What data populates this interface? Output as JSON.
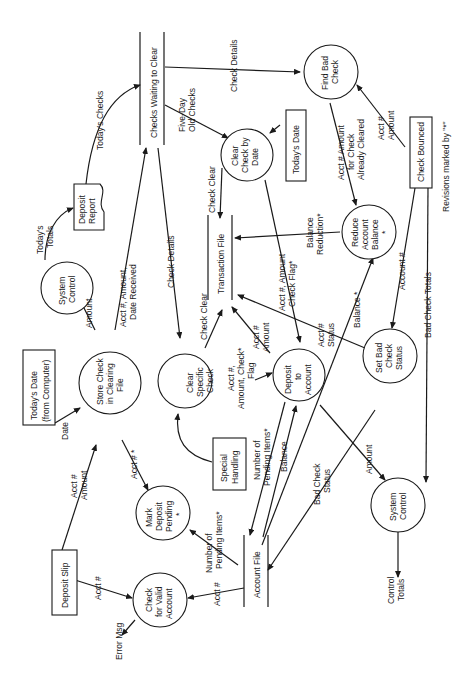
{
  "diagram": {
    "type": "data-flow-diagram",
    "orientation": "rotated-90-ccw",
    "note": "Revisions marked by \"*\"",
    "processes": {
      "system_control_top": [
        "System",
        "Control"
      ],
      "store_check": [
        "Store Check",
        "in Clearing",
        "File"
      ],
      "mark_deposit": [
        "Mark",
        "Deposit",
        "Pending",
        "*"
      ],
      "check_valid": [
        "Check",
        "for Valid",
        "Account"
      ],
      "clear_specific": [
        "Clear",
        "Specific",
        "Check"
      ],
      "clear_by_date": [
        "Clear",
        "Check by",
        "Date"
      ],
      "deposit_account": [
        "Deposit",
        "to",
        "Account"
      ],
      "find_bad_check": [
        "Find Bad",
        "Check"
      ],
      "reduce_balance": [
        "Reduce",
        "Account",
        "Balance",
        "*"
      ],
      "set_bad_status": [
        "Set Bad",
        "Check",
        "Status"
      ],
      "system_control_bottom": [
        "System",
        "Control"
      ]
    },
    "externals": {
      "deposit_slip": "Deposit Slip",
      "todays_date_computer": [
        "Today's Date",
        "(from Computer)"
      ],
      "special_handling": [
        "Special",
        "Handling"
      ],
      "todays_date": "Today's Date",
      "check_bounced": "Check Bounced"
    },
    "documents": {
      "deposit_report": [
        "Deposit",
        "Report"
      ]
    },
    "stores": {
      "checks_waiting": "Checks Waiting to Clear",
      "transaction_file": "Transaction File",
      "account_file": "Account File"
    },
    "flows": {
      "todays_checks": "Today's Checks",
      "todays_totals": [
        "Today's",
        "Totals"
      ],
      "amount_1": "Amount",
      "acct_amt_date": [
        "Acct #, Amount,",
        "Date Received"
      ],
      "date": "Date",
      "acct_amount_1": [
        "Acct #",
        "Amount"
      ],
      "acct_star": "Acct # *",
      "acct_1": "Acct #",
      "error_msg": "Error Msg",
      "acct_2": "Acct #",
      "num_pending_1": [
        "Number of",
        "Pending Items*"
      ],
      "check_details_1": "Check Details",
      "check_clear_1": "Check Clear",
      "check_clear_2": "Check Clear",
      "five_day": [
        "Five-Day",
        "Old Checks"
      ],
      "check_details_2": "Check Details",
      "acct_amt_flag_1": [
        "Acct #,",
        "Amount, Check*",
        "Flag"
      ],
      "acct_amount_2": [
        "Acct #",
        "Amount"
      ],
      "acct_amt_flag_2": [
        "Acct #, Amount",
        "Check Flag*"
      ],
      "num_pending_2": [
        "Number of",
        "Pending Items*"
      ],
      "balance": "Balance",
      "bad_check_status": [
        "Bad Check",
        "Status"
      ],
      "amount_2": "Amount",
      "acct_status": [
        "Acct #",
        "Status"
      ],
      "balance_star": "Balance *",
      "balance_reduction": [
        "Balance",
        "Reduction*"
      ],
      "acct_amt_cleared": [
        "Acct # Amount",
        "for Check",
        "Already Cleared"
      ],
      "acct_amount_3": [
        "Acct #",
        "Amount"
      ],
      "account_num": "Account #",
      "bad_check_totals": "Bad Check Totals",
      "control_totals": [
        "Control",
        "Totals"
      ]
    }
  }
}
